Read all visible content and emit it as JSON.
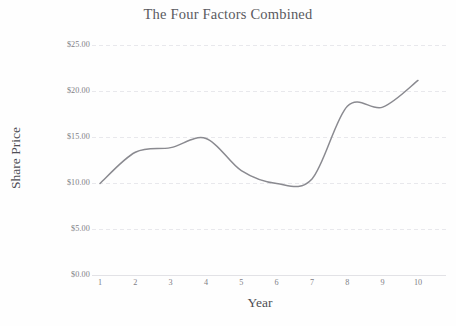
{
  "chart_data": {
    "type": "line",
    "title": "The Four Factors Combined",
    "xlabel": "Year",
    "ylabel": "Share Price",
    "x": [
      1,
      2,
      3,
      4,
      5,
      6,
      7,
      8,
      9,
      10
    ],
    "values": [
      10.0,
      13.4,
      13.9,
      14.9,
      11.4,
      10.0,
      10.5,
      18.4,
      18.3,
      21.2
    ],
    "series": [
      {
        "name": "Share Price",
        "values": [
          10.0,
          13.4,
          13.9,
          14.9,
          11.4,
          10.0,
          10.5,
          18.4,
          18.3,
          21.2
        ]
      }
    ],
    "xtick_labels": [
      "1",
      "2",
      "3",
      "4",
      "5",
      "6",
      "7",
      "8",
      "9",
      "10"
    ],
    "ytick_labels": [
      "$25.00",
      "$20.00",
      "$15.00",
      "$10.00",
      "$5.00",
      "$0.00"
    ],
    "ytick_values": [
      25,
      20,
      15,
      10,
      5,
      0
    ],
    "ylim": [
      0,
      25
    ],
    "xlim": [
      1,
      10
    ],
    "grid": true,
    "grid_style": "dashed",
    "legend": false,
    "line_color": "#8a8a90",
    "grid_color": "#e8e8ec",
    "axis_color": "#e2e2e6",
    "title_color": "#5a5a60",
    "label_color": "#7e7e86",
    "background_color": "#fefefe",
    "smoothing": "spline"
  }
}
